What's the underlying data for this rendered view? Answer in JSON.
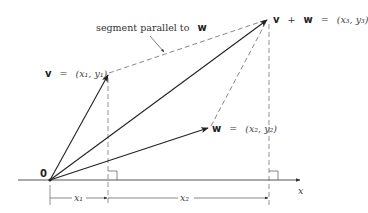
{
  "diagram": {
    "colors": {
      "ink": "#2a2a2a",
      "dashed": "#555555",
      "background": "#ffffff"
    },
    "labels": {
      "origin": "0",
      "v_name": "v",
      "v_eq": "=",
      "v_coords": "(x₁, y₁)",
      "w_name": "w",
      "w_eq": "=",
      "w_coords": "(x₂, y₂)",
      "sum_v": "v",
      "sum_plus": "+",
      "sum_w": "w",
      "sum_eq": "=",
      "sum_coords": "(x₃, y₃)",
      "segment_note_text": "segment parallel to",
      "segment_note_vec": "w",
      "x_axis": "x",
      "dim_x1": "x₁",
      "dim_x2": "x₂"
    },
    "points": {
      "origin": [
        50,
        180
      ],
      "v": [
        108,
        74
      ],
      "w": [
        209,
        128
      ],
      "v_plus_w": [
        268,
        19
      ]
    }
  }
}
